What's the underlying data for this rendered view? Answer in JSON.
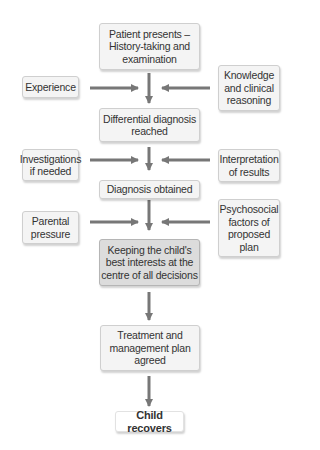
{
  "diagram": {
    "main_flow": [
      {
        "id": "patient-presents",
        "label": "Patient presents – History-taking and examination"
      },
      {
        "id": "differential-diagnosis",
        "label": "Differential diagnosis reached"
      },
      {
        "id": "diagnosis-obtained",
        "label": "Diagnosis obtained"
      },
      {
        "id": "best-interests",
        "label": "Keeping the child's best interests at the centre of all decisions"
      },
      {
        "id": "treatment-plan",
        "label": "Treatment and management plan agreed"
      },
      {
        "id": "child-recovers",
        "label": "Child recovers"
      }
    ],
    "left_inputs": [
      {
        "id": "experience",
        "label": "Experience"
      },
      {
        "id": "investigations",
        "label": "Investigations if needed"
      },
      {
        "id": "parental-pressure",
        "label": "Parental pressure"
      }
    ],
    "right_inputs": [
      {
        "id": "knowledge",
        "label": "Knowledge and clinical reasoning"
      },
      {
        "id": "interpretation",
        "label": "Interpretation of results"
      },
      {
        "id": "psychosocial",
        "label": "Psychosocial factors of proposed plan"
      }
    ],
    "colors": {
      "box_fill": "#f4f4f4",
      "highlight_fill": "#dcdcdc",
      "arrow": "#777777",
      "text": "#333333"
    }
  }
}
